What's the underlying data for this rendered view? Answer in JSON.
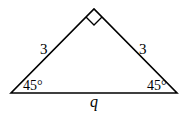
{
  "diagram": {
    "type": "right isosceles triangle",
    "sides": {
      "left_leg": "3",
      "right_leg": "3",
      "hypotenuse": "q"
    },
    "angles": {
      "bottom_left": "45°",
      "bottom_right": "45°",
      "apex": "right angle"
    }
  }
}
